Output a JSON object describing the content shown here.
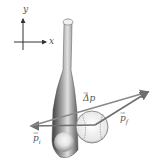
{
  "diagram": {
    "axes": {
      "x_label": "x",
      "y_label": "y"
    },
    "vectors": [
      {
        "name": "p_i",
        "label": "p",
        "subscript": "i",
        "description": "initial momentum of ball, pointing left"
      },
      {
        "name": "p_f",
        "label": "p",
        "subscript": "f",
        "description": "final momentum of ball, pointing up-right"
      },
      {
        "name": "delta_p",
        "label": "Δp",
        "subscript": "",
        "description": "change in momentum, from tip of p_i to tip of p_f"
      }
    ],
    "objects": [
      "baseball bat",
      "baseball"
    ],
    "colors": {
      "vector": "#6f6f6f",
      "bat_dark": "#4a4a4a",
      "bat_light": "#d8d8d8",
      "ball": "#f2f2f2",
      "axes": "#333333",
      "text": "#555555"
    }
  }
}
